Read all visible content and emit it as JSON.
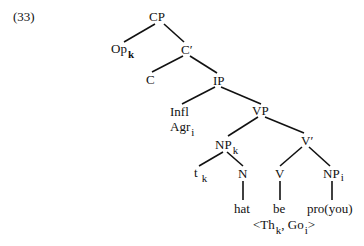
{
  "example_number": "(33)",
  "nodes": {
    "cp": "CP",
    "op": "Op",
    "op_sub": "k",
    "cbar": "C′",
    "c": "C",
    "ip": "IP",
    "infl": "Infl",
    "agr": "Agr",
    "agr_sub": "i",
    "vp": "VP",
    "np_k": "NP",
    "np_k_sub": "k",
    "vbar": "V′",
    "t": "t",
    "t_sub": "k",
    "n": "N",
    "v": "V",
    "np_i": "NP",
    "np_i_sub": "i"
  },
  "terminals": {
    "hat": "hat",
    "be": "be",
    "pro": "pro(you)"
  },
  "theta_grid": {
    "open": "<Th",
    "th_sub": "k",
    "comma": ", Go",
    "go_sub": "i",
    "close": ">"
  }
}
